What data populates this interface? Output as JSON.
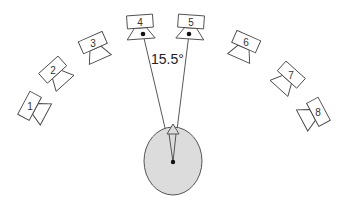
{
  "diagram": {
    "title": "",
    "angle_label": "15.5°",
    "colors": {
      "head_fill": "#dcdcdc",
      "outline": "#444444",
      "background": "#ffffff"
    },
    "listener": {
      "label": ""
    },
    "speakers": [
      {
        "id": 1,
        "label": "1",
        "cx": 30,
        "cy": 106,
        "rotation": -62
      },
      {
        "id": 2,
        "label": "2",
        "cx": 53,
        "cy": 70,
        "rotation": -42
      },
      {
        "id": 3,
        "label": "3",
        "cx": 93,
        "cy": 43,
        "rotation": -24
      },
      {
        "id": 4,
        "label": "4",
        "cx": 140,
        "cy": 23,
        "rotation": -5
      },
      {
        "id": 5,
        "label": "5",
        "cx": 191,
        "cy": 23,
        "rotation": 5
      },
      {
        "id": 6,
        "label": "6",
        "cx": 246,
        "cy": 42,
        "rotation": 24
      },
      {
        "id": 7,
        "label": "7",
        "cx": 291,
        "cy": 75,
        "rotation": 42
      },
      {
        "id": 8,
        "label": "8",
        "cx": 318,
        "cy": 112,
        "rotation": 62
      }
    ]
  }
}
